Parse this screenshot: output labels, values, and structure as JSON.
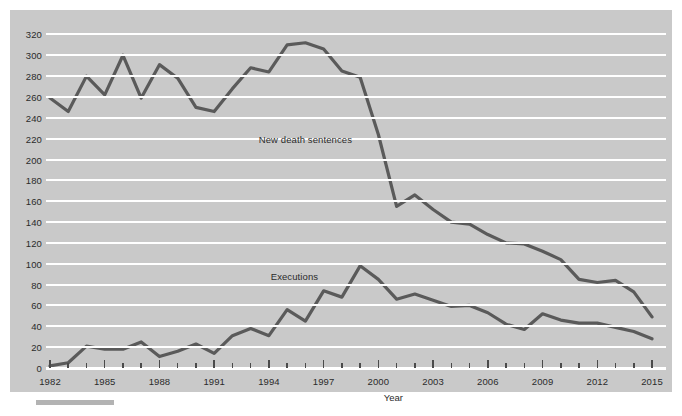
{
  "chart_data": {
    "type": "line",
    "title": "",
    "xlabel": "Year",
    "ylabel": "",
    "ylim": [
      0,
      330
    ],
    "xlim": [
      1982,
      2015
    ],
    "grid": true,
    "legend": "inline-annotations",
    "ytick_labels": [
      "0",
      "20",
      "40",
      "60",
      "80",
      "100",
      "120",
      "140",
      "160",
      "180",
      "200",
      "220",
      "240",
      "260",
      "280",
      "300",
      "320"
    ],
    "ytick_values": [
      0,
      20,
      40,
      60,
      80,
      100,
      120,
      140,
      160,
      180,
      200,
      220,
      240,
      260,
      280,
      300,
      320
    ],
    "xtick_labels": [
      "1982",
      "1985",
      "1988",
      "1991",
      "1994",
      "1997",
      "2000",
      "2003",
      "2006",
      "2009",
      "2012",
      "2015"
    ],
    "xtick_values": [
      1982,
      1985,
      1988,
      1991,
      1994,
      1997,
      2000,
      2003,
      2006,
      2009,
      2012,
      2015
    ],
    "x": [
      1982,
      1983,
      1984,
      1985,
      1986,
      1987,
      1988,
      1989,
      1990,
      1991,
      1992,
      1993,
      1994,
      1995,
      1996,
      1997,
      1998,
      1999,
      2000,
      2001,
      2002,
      2003,
      2004,
      2005,
      2006,
      2007,
      2008,
      2009,
      2010,
      2011,
      2012,
      2013,
      2014,
      2015
    ],
    "series": [
      {
        "name": "New death sentences",
        "color": "#5a5a5a",
        "values": [
          259,
          246,
          280,
          262,
          300,
          259,
          291,
          278,
          250,
          246,
          268,
          288,
          284,
          310,
          312,
          306,
          285,
          279,
          224,
          155,
          166,
          152,
          140,
          138,
          128,
          120,
          119,
          112,
          104,
          85,
          82,
          84,
          73,
          49
        ]
      },
      {
        "name": "Executions",
        "color": "#5a5a5a",
        "values": [
          2,
          5,
          21,
          18,
          18,
          25,
          11,
          16,
          23,
          14,
          31,
          38,
          31,
          56,
          45,
          74,
          68,
          98,
          85,
          66,
          71,
          65,
          59,
          60,
          53,
          42,
          37,
          52,
          46,
          43,
          43,
          39,
          35,
          28
        ]
      }
    ],
    "annotations": [
      {
        "text": "New death sentences",
        "x": 1996.0,
        "y": 218
      },
      {
        "text": "Executions",
        "x": 1995.4,
        "y": 86
      }
    ]
  },
  "axis": {
    "x_title": "Year"
  },
  "style": {
    "plot_background": "#c9c9c9",
    "gridline_color": "#ffffff",
    "line_color": "#5a5a5a",
    "text_color": "#2b2b2b",
    "page_background": "#ffffff",
    "footer_bar_color": "#b3b3b3"
  }
}
